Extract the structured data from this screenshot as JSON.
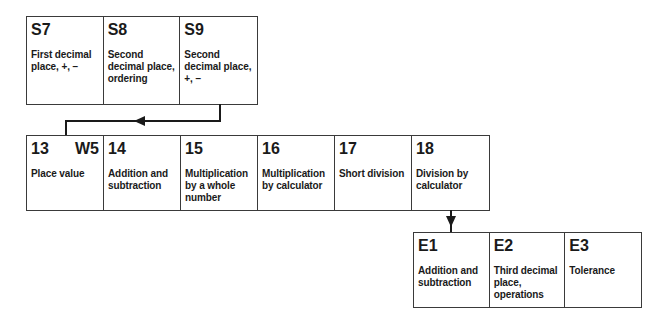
{
  "rows": {
    "top": [
      {
        "code": "S7",
        "desc": "First decimal place, +, −"
      },
      {
        "code": "S8",
        "desc": "Second decimal place, ordering"
      },
      {
        "code": "S9",
        "desc": "Second decimal place, +, −"
      }
    ],
    "middle": [
      {
        "code": "13",
        "tag": "W5",
        "desc": "Place value"
      },
      {
        "code": "14",
        "desc": "Addition and subtraction"
      },
      {
        "code": "15",
        "desc": "Multiplication by a whole number"
      },
      {
        "code": "16",
        "desc": "Multiplication by calculator"
      },
      {
        "code": "17",
        "desc": "Short division"
      },
      {
        "code": "18",
        "desc": "Division by calculator"
      }
    ],
    "bottom": [
      {
        "code": "E1",
        "desc": "Addition and subtraction"
      },
      {
        "code": "E2",
        "desc": "Third decimal place, operations"
      },
      {
        "code": "E3",
        "desc": "Tolerance"
      }
    ]
  },
  "connectors": [
    {
      "from": "S9",
      "to": "13",
      "direction": "left"
    },
    {
      "from": "18",
      "to": "E1",
      "direction": "down"
    }
  ]
}
